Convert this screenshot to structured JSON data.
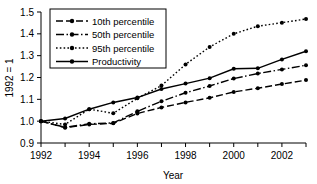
{
  "chart_data": {
    "type": "line",
    "title": "",
    "xlabel": "Year",
    "ylabel": "1992 = 1",
    "xlim": [
      1992,
      2003
    ],
    "ylim": [
      0.9,
      1.5
    ],
    "ytick_labels": [
      "0.9",
      "1.0",
      "1.1",
      "1.2",
      "1.3",
      "1.4",
      "1.5"
    ],
    "ytick_values": [
      0.9,
      1.0,
      1.1,
      1.2,
      1.3,
      1.4,
      1.5
    ],
    "xtick_labels": [
      "1992",
      "1994",
      "1996",
      "1998",
      "2000",
      "2002"
    ],
    "xtick_values": [
      1992,
      1994,
      1996,
      1998,
      2000,
      2002
    ],
    "x": [
      1992,
      1993,
      1994,
      1995,
      1996,
      1997,
      1998,
      1999,
      2000,
      2001,
      2002,
      2003
    ],
    "grid": false,
    "legend_position": "top-left",
    "series": [
      {
        "name": "10th percentile",
        "style": "dashed",
        "values": [
          1.0,
          0.97,
          0.985,
          0.99,
          1.035,
          1.063,
          1.086,
          1.107,
          1.134,
          1.151,
          1.17,
          1.188
        ]
      },
      {
        "name": "50th percentile",
        "style": "dash-dot",
        "values": [
          1.0,
          0.972,
          0.988,
          0.992,
          1.045,
          1.091,
          1.13,
          1.161,
          1.195,
          1.218,
          1.237,
          1.256
        ]
      },
      {
        "name": "95th percentile",
        "style": "dotted",
        "values": [
          1.0,
          0.985,
          1.055,
          1.036,
          1.105,
          1.163,
          1.26,
          1.34,
          1.4,
          1.435,
          1.451,
          1.468
        ]
      },
      {
        "name": "Productivity",
        "style": "solid",
        "values": [
          1.0,
          1.012,
          1.055,
          1.086,
          1.108,
          1.147,
          1.172,
          1.197,
          1.24,
          1.242,
          1.283,
          1.32
        ]
      }
    ]
  },
  "legend": {
    "entries": [
      {
        "label": "10th percentile"
      },
      {
        "label": "50th percentile"
      },
      {
        "label": "95th percentile"
      },
      {
        "label": "Productivity"
      }
    ]
  }
}
